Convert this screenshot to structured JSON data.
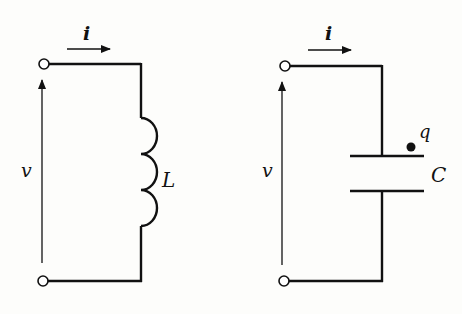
{
  "diagram": {
    "type": "circuit-schematic",
    "circuits": [
      {
        "id": "inductor-circuit",
        "element": "inductor",
        "current_label": "i",
        "voltage_label": "v",
        "element_label": "L"
      },
      {
        "id": "capacitor-circuit",
        "element": "capacitor",
        "current_label": "i",
        "voltage_label": "v",
        "element_label": "C",
        "charge_label": "q"
      }
    ]
  },
  "colors": {
    "background": "#fdfdfb",
    "ink": "#111111"
  }
}
